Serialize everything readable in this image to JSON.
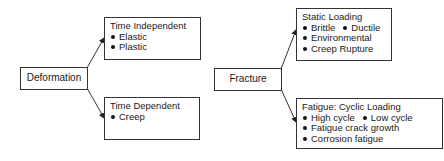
{
  "diagram": {
    "deformation": {
      "label": "Deformation",
      "children": [
        {
          "title": "Time Independent",
          "items": [
            "Elastic",
            "Plastic"
          ]
        },
        {
          "title": "Time Dependent",
          "items": [
            "Creep"
          ]
        }
      ]
    },
    "fracture": {
      "label": "Fracture",
      "children": [
        {
          "title": "Static Loading",
          "rows": [
            [
              "Brittle",
              "Ductile"
            ],
            [
              "Environmental"
            ],
            [
              "Creep Rupture"
            ]
          ]
        },
        {
          "title": "Fatigue: Cyclic Loading",
          "rows": [
            [
              "High cycle",
              "Low cycle"
            ],
            [
              "Fatigue crack growth"
            ],
            [
              "Corrosion fatigue"
            ]
          ]
        }
      ]
    },
    "colors": {
      "line": "#333333",
      "text": "#1a1a1a",
      "background": "#ffffff"
    }
  }
}
